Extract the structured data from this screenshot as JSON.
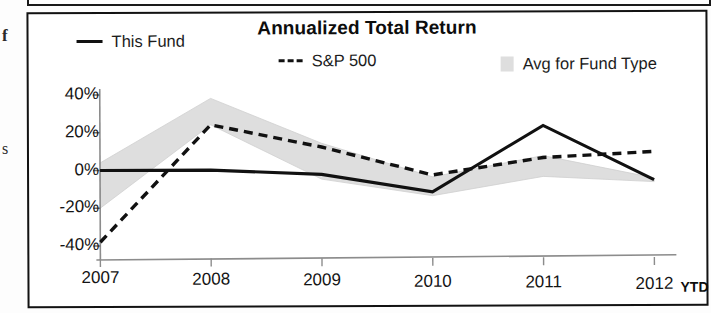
{
  "panel": {
    "edge_fragments": [
      "f",
      "s"
    ]
  },
  "chart_data": {
    "type": "line",
    "title": "Annualized Total Return",
    "xlabel": "",
    "ylabel": "",
    "x_axis_suffix": "YTD",
    "categories": [
      "2007",
      "2008",
      "2009",
      "2010",
      "2011",
      "2012"
    ],
    "ytick_labels": [
      "40%",
      "20%",
      "0%",
      "-20%",
      "-40%"
    ],
    "ytick_values": [
      40,
      20,
      0,
      -20,
      -40
    ],
    "ylim": [
      -45,
      45
    ],
    "grid": false,
    "legend_position": "top",
    "series": [
      {
        "name": "This Fund",
        "style": "solid",
        "color": "#111111",
        "values": [
          0,
          0,
          -2.5,
          -12,
          23,
          -6
        ]
      },
      {
        "name": "S&P 500",
        "style": "dashed",
        "color": "#111111",
        "values": [
          -38,
          24,
          12,
          -3,
          6,
          9
        ]
      },
      {
        "name": "Avg for Fund Type",
        "style": "band",
        "color": "#dedede",
        "upper": [
          4,
          38,
          14,
          -4,
          7,
          -5
        ],
        "lower": [
          -20,
          24,
          -5,
          -14,
          -4,
          -7
        ]
      }
    ]
  }
}
